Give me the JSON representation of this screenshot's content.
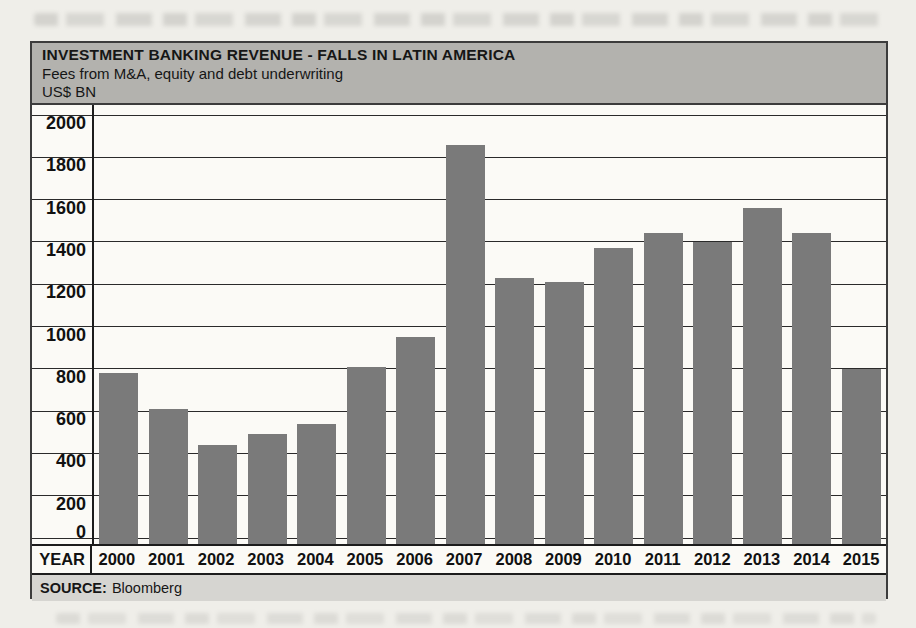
{
  "chart": {
    "title": "INVESTMENT BANKING REVENUE - FALLS IN LATIN AMERICA",
    "subtitle": "Fees from M&A, equity and debt underwriting",
    "units": "US$ BN",
    "x_axis_label": "YEAR",
    "source_label": "SOURCE:",
    "source_value": "Bloomberg"
  },
  "chart_data": {
    "type": "bar",
    "title": "INVESTMENT BANKING REVENUE - FALLS IN LATIN AMERICA",
    "subtitle": "Fees from M&A, equity and debt underwriting",
    "ylabel": "US$ BN",
    "xlabel": "YEAR",
    "categories": [
      "2000",
      "2001",
      "2002",
      "2003",
      "2004",
      "2005",
      "2006",
      "2007",
      "2008",
      "2009",
      "2010",
      "2011",
      "2012",
      "2013",
      "2014",
      "2015"
    ],
    "values": [
      780,
      610,
      440,
      490,
      540,
      810,
      950,
      1860,
      1230,
      1210,
      1370,
      1440,
      1400,
      1560,
      1440,
      800
    ],
    "ylim": [
      0,
      2000
    ],
    "yticks": [
      0,
      200,
      400,
      600,
      800,
      1000,
      1200,
      1400,
      1600,
      1800,
      2000
    ],
    "grid": true,
    "legend": "none",
    "source": "Bloomberg"
  },
  "colors": {
    "page_bg": "#efeee9",
    "plot_bg": "#fbfaf6",
    "header_bg": "#b3b2ae",
    "source_bg": "#d6d5d1",
    "bar": "#7a7a7a",
    "grid": "#2a2a2a",
    "axis": "#1c1c1c",
    "frame": "#3c3c3c"
  }
}
